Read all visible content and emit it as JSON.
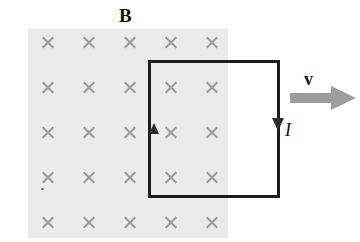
{
  "figure": {
    "width": 360,
    "height": 242,
    "background_color": "#ffffff"
  },
  "field_region": {
    "name": "magnetic-field-region",
    "fill_color": "#ebebeb",
    "x": 28,
    "y": 29,
    "width": 200,
    "height": 209,
    "direction": "into-page",
    "marker_glyph": "x",
    "marker_color": "#9a9a9a",
    "marker_grid": {
      "columns": 5,
      "rows": 5,
      "x_start": 48,
      "y_start": 42,
      "x_spacing": 41,
      "y_spacing": 45
    }
  },
  "loop": {
    "name": "conducting-loop",
    "stroke_color": "#1c1c1c",
    "stroke_width": 3,
    "x": 148,
    "y": 60,
    "width": 132,
    "height": 138,
    "current_direction": "counterclockwise"
  },
  "labels": {
    "field": "B",
    "velocity": "v",
    "current": "I"
  },
  "velocity_arrow": {
    "name": "velocity-arrow",
    "color": "#9d9d9d",
    "direction": "right",
    "x": 290,
    "y": 98,
    "length": 66
  },
  "current_arrows": [
    {
      "name": "current-arrow-left",
      "direction": "up",
      "x": 154,
      "y": 129
    },
    {
      "name": "current-arrow-right",
      "direction": "down",
      "x": 278,
      "y": 125
    }
  ]
}
